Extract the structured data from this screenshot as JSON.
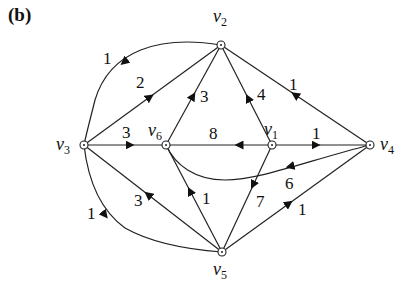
{
  "panel_label": "(b)",
  "nodes": [
    {
      "id": "v1",
      "label": "v",
      "sub": "1",
      "x": 272,
      "y": 145
    },
    {
      "id": "v2",
      "label": "v",
      "sub": "2",
      "x": 221,
      "y": 45
    },
    {
      "id": "v3",
      "label": "v",
      "sub": "3",
      "x": 84,
      "y": 145
    },
    {
      "id": "v4",
      "label": "v",
      "sub": "4",
      "x": 370,
      "y": 145
    },
    {
      "id": "v5",
      "label": "v",
      "sub": "5",
      "x": 222,
      "y": 252
    },
    {
      "id": "v6",
      "label": "v",
      "sub": "6",
      "x": 166,
      "y": 145
    }
  ],
  "edges": [
    {
      "from": "v2",
      "to": "v3",
      "weight": "1",
      "curved": true
    },
    {
      "from": "v3",
      "to": "v2",
      "weight": "2"
    },
    {
      "from": "v3",
      "to": "v6",
      "weight": "3"
    },
    {
      "from": "v6",
      "to": "v2",
      "weight": "3"
    },
    {
      "from": "v1",
      "to": "v2",
      "weight": "4"
    },
    {
      "from": "v4",
      "to": "v2",
      "weight": "1"
    },
    {
      "from": "v1",
      "to": "v6",
      "weight": "8"
    },
    {
      "from": "v1",
      "to": "v4",
      "weight": "1"
    },
    {
      "from": "v4",
      "to": "v6",
      "weight": "6",
      "curved": true
    },
    {
      "from": "v5",
      "to": "v3",
      "weight": "3"
    },
    {
      "from": "v3",
      "to": "v5",
      "weight": "1",
      "curved": true
    },
    {
      "from": "v5",
      "to": "v6",
      "weight": "1"
    },
    {
      "from": "v1",
      "to": "v5",
      "weight": "7"
    },
    {
      "from": "v5",
      "to": "v4",
      "weight": "1"
    }
  ]
}
